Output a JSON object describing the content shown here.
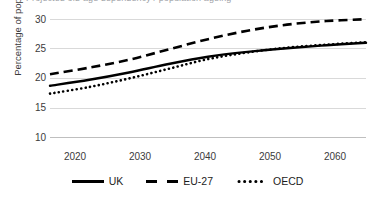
{
  "title": {
    "text": "Projected old-age dependency / population ageing",
    "visible_partial": true
  },
  "axes": {
    "y_title": "Percentage of population",
    "y_ticks": [
      "30",
      "25",
      "20",
      "15",
      "10"
    ],
    "x_ticks": [
      "2020",
      "2030",
      "2040",
      "2050",
      "2060"
    ]
  },
  "legend": {
    "items": [
      {
        "label": "UK",
        "style": "solid",
        "color": "#000000"
      },
      {
        "label": "EU-27",
        "style": "dashed",
        "color": "#000000"
      },
      {
        "label": "OECD",
        "style": "dotted",
        "color": "#000000"
      }
    ]
  },
  "chart_data": {
    "type": "line",
    "title": "Projected old-age dependency / population ageing",
    "xlabel": "",
    "ylabel": "Percentage of population",
    "xlim": [
      2020,
      2060
    ],
    "ylim": [
      10,
      30
    ],
    "x_ticks": [
      2020,
      2030,
      2040,
      2050,
      2060
    ],
    "y_ticks": [
      10,
      15,
      20,
      25,
      30
    ],
    "grid": true,
    "legend_position": "bottom",
    "x": [
      2020,
      2025,
      2030,
      2035,
      2040,
      2045,
      2050,
      2055,
      2060
    ],
    "series": [
      {
        "name": "UK",
        "style": "solid",
        "color": "#000000",
        "values": [
          18.8,
          19.8,
          21.0,
          22.4,
          23.6,
          24.4,
          25.0,
          25.5,
          25.9
        ]
      },
      {
        "name": "EU-27",
        "style": "dashed",
        "color": "#000000",
        "values": [
          20.7,
          21.8,
          23.1,
          24.8,
          26.5,
          27.9,
          28.9,
          29.5,
          29.8
        ]
      },
      {
        "name": "OECD",
        "style": "dotted",
        "color": "#000000",
        "values": [
          17.5,
          18.6,
          20.0,
          21.6,
          23.2,
          24.3,
          25.1,
          25.6,
          26.0
        ]
      }
    ]
  },
  "colors": {
    "gridline": "#d9d9d9",
    "axis": "#bfbfbf",
    "text": "#3b3b3b",
    "series": "#000000",
    "background": "#ffffff"
  }
}
